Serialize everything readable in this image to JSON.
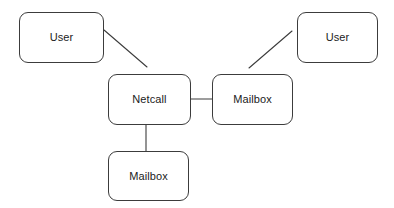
{
  "diagram": {
    "background_color": "#ffffff",
    "edge_color": "#3c3c3c",
    "node_border_color": "#3c3c3c",
    "node_fill_color": "#ffffff",
    "label_color": "#1b1b1b",
    "width": 394,
    "height": 208,
    "nodes": [
      {
        "id": "user-left",
        "label": "User",
        "x": 19,
        "y": 12,
        "w": 85,
        "h": 51
      },
      {
        "id": "user-right",
        "label": "User",
        "x": 297,
        "y": 12,
        "w": 81,
        "h": 51
      },
      {
        "id": "netcall",
        "label": "Netcall",
        "x": 108,
        "y": 74,
        "w": 83,
        "h": 51
      },
      {
        "id": "mailbox-right",
        "label": "Mailbox",
        "x": 212,
        "y": 74,
        "w": 81,
        "h": 51
      },
      {
        "id": "mailbox-bottom",
        "label": "Mailbox",
        "x": 108,
        "y": 151,
        "w": 81,
        "h": 50
      }
    ],
    "edges": [
      {
        "id": "edge-user-left-netcall",
        "from": "user-left",
        "to": "netcall",
        "kind": "diagonal",
        "x1": 104,
        "y1": 30,
        "x2": 147,
        "y2": 67
      },
      {
        "id": "edge-netcall-mailbox-right",
        "from": "netcall",
        "to": "mailbox-right",
        "kind": "horizontal",
        "x1": 191,
        "y1": 99,
        "x2": 212,
        "y2": 99
      },
      {
        "id": "edge-mailbox-right-user-right",
        "from": "mailbox-right",
        "to": "user-right",
        "kind": "diagonal",
        "x1": 249,
        "y1": 68,
        "x2": 292,
        "y2": 31
      },
      {
        "id": "edge-netcall-mailbox-bottom",
        "from": "netcall",
        "to": "mailbox-bottom",
        "kind": "vertical",
        "x1": 146,
        "y1": 125,
        "x2": 146,
        "y2": 151
      }
    ]
  }
}
